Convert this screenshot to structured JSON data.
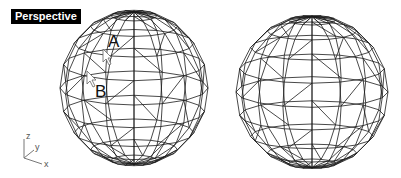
{
  "viewport": {
    "title": "Perspective",
    "background": "#ffffff",
    "wire_color": "#1a1a1a"
  },
  "objects": [
    {
      "name": "left-sphere",
      "cx": 134,
      "cy": 88,
      "rx": 74,
      "ry": 78,
      "tilt": 0.22,
      "lat_bands": 10,
      "lon_segments": 16
    },
    {
      "name": "right-sphere",
      "cx": 312,
      "cy": 92,
      "rx": 76,
      "ry": 77,
      "tilt": 0.2,
      "lat_bands": 10,
      "lon_segments": 16
    }
  ],
  "annotations": {
    "point_a": {
      "label": "A",
      "x": 108,
      "y": 34
    },
    "point_b": {
      "label": "B",
      "x": 95,
      "y": 84
    }
  },
  "axes": {
    "z_label": "z",
    "y_label": "y",
    "x_label": "x"
  }
}
